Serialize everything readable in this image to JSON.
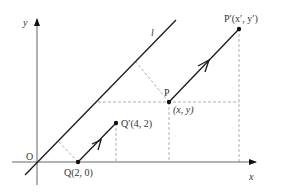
{
  "diagram": {
    "axes": {
      "x_label": "x",
      "y_label": "y",
      "origin_label": "O"
    },
    "line": {
      "label": "l"
    },
    "points": {
      "P": {
        "label": "P",
        "coord_label": "(x, y)"
      },
      "P_prime": {
        "label": "P′(x′, y′)"
      },
      "Q": {
        "label": "Q(2, 0)"
      },
      "Q_prime": {
        "label": "Q′(4, 2)"
      }
    },
    "colors": {
      "line": "#1a1a1a",
      "axis": "#555555",
      "dashed": "#999999",
      "text": "#333333"
    }
  }
}
